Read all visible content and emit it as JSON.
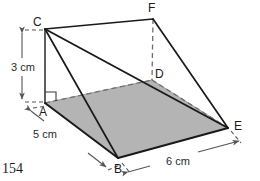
{
  "figure": {
    "type": "geometry-diagram",
    "shape_name": "triangular-prism-wedge",
    "page_number": "154",
    "colors": {
      "shaded_face": "#b4b4b4",
      "shaded_face_stroke": "#8c8c8c",
      "solid_edge": "#1a1a1a",
      "hidden_edge": "#6e6e6e",
      "dimension_line": "#555555",
      "label_text": "#1a1a1a",
      "background": "#ffffff"
    },
    "vertices": [
      {
        "id": "A",
        "label": "A",
        "x": 45,
        "y": 103,
        "label_x": 39,
        "label_y": 106,
        "hidden": false
      },
      {
        "id": "B",
        "label": "B",
        "x": 118,
        "y": 158,
        "label_x": 114,
        "label_y": 163,
        "hidden": false
      },
      {
        "id": "C",
        "label": "C",
        "x": 45,
        "y": 29,
        "label_x": 33,
        "label_y": 16,
        "hidden": false
      },
      {
        "id": "D",
        "label": "D",
        "x": 152,
        "y": 80,
        "label_x": 155,
        "label_y": 68,
        "hidden": true
      },
      {
        "id": "E",
        "label": "E",
        "x": 228,
        "y": 128,
        "label_x": 234,
        "label_y": 120,
        "hidden": false
      },
      {
        "id": "F",
        "label": "F",
        "x": 153,
        "y": 19,
        "label_x": 148,
        "label_y": 2,
        "hidden": false
      }
    ],
    "solid_edges": [
      {
        "from": "C",
        "to": "F"
      },
      {
        "from": "C",
        "to": "E"
      },
      {
        "from": "C",
        "to": "B"
      },
      {
        "from": "C",
        "to": "A"
      },
      {
        "from": "F",
        "to": "E"
      },
      {
        "from": "B",
        "to": "E"
      },
      {
        "from": "A",
        "to": "B"
      }
    ],
    "hidden_edges": [
      {
        "from": "F",
        "to": "D"
      },
      {
        "from": "A",
        "to": "D"
      },
      {
        "from": "D",
        "to": "E"
      }
    ],
    "shaded_face": {
      "name": "base-face-ABED",
      "points": "45,103 118,158 228,128 152,80"
    },
    "right_angle_marker": {
      "at": "A",
      "size": 11
    },
    "dimensions": [
      {
        "id": "height",
        "label": "3 cm",
        "value": 3,
        "unit": "cm",
        "measures": "C-to-A",
        "label_x": 11,
        "label_y": 62,
        "line": {
          "x1": 22,
          "y1": 33,
          "x2": 22,
          "y2": 99
        },
        "orientation": "vertical"
      },
      {
        "id": "depth",
        "label": "5 cm",
        "value": 5,
        "unit": "cm",
        "measures": "A-to-B",
        "label_x": 33,
        "label_y": 129,
        "line": {
          "x1": 32,
          "y1": 112,
          "x2": 106,
          "y2": 167
        },
        "orientation": "diagonal"
      },
      {
        "id": "width",
        "label": "6 cm",
        "value": 6,
        "unit": "cm",
        "measures": "B-to-E",
        "label_x": 166,
        "label_y": 156,
        "line": {
          "x1": 127,
          "y1": 172,
          "x2": 239,
          "y2": 141
        },
        "orientation": "diagonal"
      }
    ],
    "leader_lines": [
      {
        "from_x": 40,
        "from_y": 123,
        "to_x": 28,
        "to_y": 109
      },
      {
        "from_x": 70,
        "from_y": 131,
        "to_x": 82,
        "to_y": 146
      }
    ]
  }
}
